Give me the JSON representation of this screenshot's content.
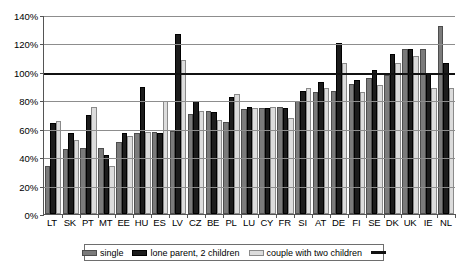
{
  "chart_data": {
    "type": "bar",
    "title": "",
    "xlabel": "",
    "ylabel": "",
    "ylim": [
      0,
      140
    ],
    "ytick_step": 20,
    "ytick_labels": [
      "0%",
      "20%",
      "40%",
      "60%",
      "80%",
      "100%",
      "120%",
      "140%"
    ],
    "grid": true,
    "legend_position": "bottom",
    "reference_line": {
      "value": 100,
      "label": "",
      "color": "#111111"
    },
    "categories": [
      "LT",
      "SK",
      "PT",
      "MT",
      "EE",
      "HU",
      "ES",
      "LV",
      "CZ",
      "BE",
      "PL",
      "LU",
      "CY",
      "FR",
      "SI",
      "AT",
      "DE",
      "FI",
      "SE",
      "DK",
      "UK",
      "IE",
      "NL"
    ],
    "series": [
      {
        "name": "single",
        "color": "#7b7b7b",
        "values": [
          34,
          46,
          47,
          47,
          51,
          57.5,
          58,
          59,
          71,
          72.5,
          65,
          74,
          75,
          76,
          80,
          86,
          87,
          92,
          96,
          98,
          117,
          117,
          133
        ]
      },
      {
        "name": "lone parent, 2 children",
        "color": "#1c1c1c",
        "values": [
          64.5,
          57,
          70,
          42,
          57,
          90,
          57,
          127,
          80,
          72,
          83,
          76,
          75,
          75,
          87,
          93,
          121,
          95,
          102,
          113,
          117,
          100,
          107
        ]
      },
      {
        "name": "couple with two children",
        "color": "#dcdcdc",
        "values": [
          65.5,
          52.5,
          75.5,
          34,
          55,
          58,
          80,
          109,
          73,
          66.5,
          85,
          75,
          76,
          68,
          89,
          89,
          107,
          86,
          91,
          107,
          112,
          89,
          89
        ]
      }
    ]
  },
  "legend": {
    "items": [
      {
        "label": "single",
        "swatch": "single-swatch"
      },
      {
        "label": "lone parent, 2 children",
        "swatch": "lone-parent-swatch"
      },
      {
        "label": "couple with two children",
        "swatch": "couple-swatch"
      },
      {
        "label": "",
        "swatch": "reference-line-swatch"
      }
    ]
  }
}
